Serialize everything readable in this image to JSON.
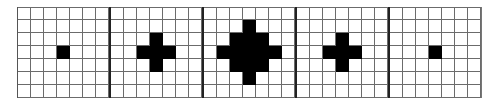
{
  "figure": {
    "grid_size": 7,
    "cell_px": 13,
    "colors": {
      "filled": "#000000",
      "empty": "#ffffff",
      "grid_line": "#6b6b6b",
      "separator": "#222222"
    },
    "panels": [
      {
        "name": "panel-1",
        "radius": 0
      },
      {
        "name": "panel-2",
        "radius": 1
      },
      {
        "name": "panel-3",
        "radius": 2
      },
      {
        "name": "panel-4",
        "radius": 1
      },
      {
        "name": "panel-5",
        "radius": 0
      }
    ]
  }
}
